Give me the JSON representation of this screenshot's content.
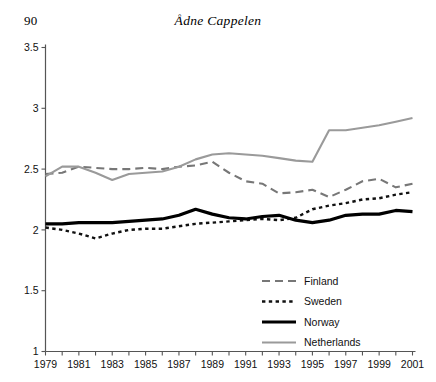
{
  "header": {
    "page_number": "90",
    "running_title": "Ådne Cappelen"
  },
  "chart_data": {
    "type": "line",
    "title": "",
    "subtitle": "",
    "xlabel": "",
    "ylabel": "",
    "xlim": [
      1979,
      2001
    ],
    "ylim": [
      1,
      3.5
    ],
    "yticks": [
      1,
      1.5,
      2,
      2.5,
      3,
      3.5
    ],
    "ytick_labels": [
      "1",
      "1.5",
      "2",
      "2.5",
      "3",
      "3.5"
    ],
    "xticks": [
      1979,
      1980,
      1981,
      1982,
      1983,
      1984,
      1985,
      1986,
      1987,
      1988,
      1989,
      1990,
      1991,
      1992,
      1993,
      1994,
      1995,
      1996,
      1997,
      1998,
      1999,
      2000,
      2001
    ],
    "xtick_labels": [
      "1979",
      "1981",
      "1983",
      "1985",
      "1987",
      "1989",
      "1991",
      "1993",
      "1995",
      "1997",
      "1999",
      "2001"
    ],
    "xtick_labelled": [
      1979,
      1981,
      1983,
      1985,
      1987,
      1989,
      1991,
      1993,
      1995,
      1997,
      1999,
      2001
    ],
    "grid": false,
    "legend_position": "center-right",
    "x": [
      1979,
      1980,
      1981,
      1982,
      1983,
      1984,
      1985,
      1986,
      1987,
      1988,
      1989,
      1990,
      1991,
      1992,
      1993,
      1994,
      1995,
      1996,
      1997,
      1998,
      1999,
      2000,
      2001
    ],
    "series": [
      {
        "name": "Finland",
        "color": "#777777",
        "style": "dashed",
        "width": 2.1,
        "values": [
          2.46,
          2.47,
          2.52,
          2.51,
          2.5,
          2.5,
          2.51,
          2.5,
          2.52,
          2.53,
          2.56,
          2.47,
          2.4,
          2.38,
          2.3,
          2.31,
          2.33,
          2.27,
          2.33,
          2.4,
          2.42,
          2.35,
          2.38
        ]
      },
      {
        "name": "Sweden",
        "color": "#111111",
        "style": "dotted",
        "width": 2.4,
        "values": [
          2.02,
          2.0,
          1.97,
          1.93,
          1.97,
          2.0,
          2.01,
          2.01,
          2.03,
          2.05,
          2.06,
          2.07,
          2.08,
          2.09,
          2.08,
          2.1,
          2.17,
          2.2,
          2.22,
          2.25,
          2.26,
          2.29,
          2.31
        ]
      },
      {
        "name": "Norway",
        "color": "#000000",
        "style": "solid",
        "width": 3.2,
        "values": [
          2.05,
          2.05,
          2.06,
          2.06,
          2.06,
          2.07,
          2.08,
          2.09,
          2.12,
          2.17,
          2.13,
          2.1,
          2.09,
          2.11,
          2.12,
          2.08,
          2.06,
          2.08,
          2.12,
          2.13,
          2.13,
          2.16,
          2.15
        ]
      },
      {
        "name": "Netherlands",
        "color": "#9a9a9a",
        "style": "solid",
        "width": 2.1,
        "values": [
          2.44,
          2.52,
          2.52,
          2.47,
          2.41,
          2.46,
          2.47,
          2.48,
          2.52,
          2.58,
          2.62,
          2.63,
          2.62,
          2.61,
          2.59,
          2.57,
          2.56,
          2.82,
          2.82,
          2.84,
          2.86,
          2.89,
          2.92
        ]
      }
    ]
  },
  "legend": {
    "items": [
      {
        "label": "Finland"
      },
      {
        "label": "Sweden"
      },
      {
        "label": "Norway"
      },
      {
        "label": "Netherlands"
      }
    ]
  }
}
